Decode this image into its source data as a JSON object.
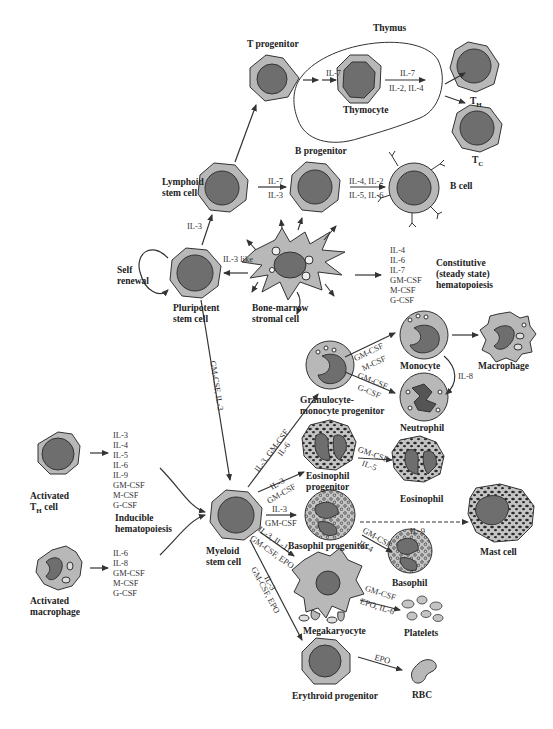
{
  "diagram": {
    "regions": {
      "thymus": "Thymus",
      "constitutive": [
        "Constitutive",
        "(steady state)",
        "hematopoiesis"
      ],
      "inducible": [
        "Inducible",
        "hematopoiesis"
      ]
    },
    "cells": {
      "t_progenitor": "T progenitor",
      "thymocyte": "Thymocyte",
      "th": "T",
      "th_sub": "H",
      "tc": "T",
      "tc_sub": "C",
      "b_progenitor": "B progenitor",
      "b_cell": "B cell",
      "lymphoid": [
        "Lymphoid",
        "stem cell"
      ],
      "self_renewal": [
        "Self",
        "renewal"
      ],
      "pluripotent": [
        "Pluripotent",
        "stem cell"
      ],
      "stromal": [
        "Bone-marrow",
        "stromal cell"
      ],
      "monocyte": "Monocyte",
      "macrophage": "Macrophage",
      "gm_progenitor": [
        "Granulocyte-",
        "monocyte progenitor"
      ],
      "neutrophil": "Neutrophil",
      "eos_progenitor": [
        "Eosinophil",
        "progenitor"
      ],
      "eosinophil": "Eosinophil",
      "baso_progenitor": "Basophil progenitor",
      "mast_cell": "Mast cell",
      "basophil": "Basophil",
      "megakaryocyte": "Megakaryocyte",
      "platelets": "Platelets",
      "erythroid": "Erythroid progenitor",
      "rbc": "RBC",
      "myeloid": [
        "Myeloid",
        "stem cell"
      ],
      "activated_th": [
        "Activated",
        "T",
        "H",
        " cell"
      ],
      "activated_mac": [
        "Activated",
        "macrophage"
      ]
    },
    "cytokines": {
      "tprog_thymocyte": "IL-7",
      "thymocyte_out_top": "IL-7",
      "thymocyte_out_bottom": "IL-2, IL-4",
      "lymphoid_bprog_top": "IL-7",
      "lymphoid_bprog_bottom": "IL-3",
      "bprog_bcell_top": "IL-4, IL-2",
      "bprog_bcell_bottom": "IL-5, IL-6",
      "pluri_lymphoid": "IL-3",
      "stromal_pluri": "IL-3 like",
      "stromal_list": [
        "IL-4",
        "IL-6",
        "IL-7",
        "GM-CSF",
        "M-CSF",
        "G-CSF"
      ],
      "pluri_myeloid": "GM-CSF, IL-3",
      "gm_mono_top": "GM-CSF",
      "gm_mono_bottom": "M-CSF",
      "gm_neut_top": "GM-CSF",
      "gm_neut_bottom": "G-CSF",
      "mono_neut": "IL-8",
      "myeloid_gm_top": "IL-3, GM-CSF",
      "myeloid_gm_bottom": "IL-6",
      "myeloid_eos_top": "IL-3",
      "myeloid_eos_bottom": "GM-CSF",
      "eos_top": "GM-CSF",
      "eos_bottom": "IL-5",
      "myeloid_baso_top": "IL-3",
      "myeloid_baso_bottom": "GM-CSF",
      "mast": "IL-9",
      "baso_top": "GM-CSF",
      "baso_bottom": "IL-4",
      "myeloid_mega_top": "IL-3, IL-11",
      "myeloid_mega_bottom": "GM-CSF, EPO",
      "myeloid_ery_top": "IL-3",
      "myeloid_ery_bottom": "GM-CSF, EPO",
      "mega_plt_top": "GM-CSF",
      "mega_plt_bottom": "EPO, IL-6",
      "ery_rbc": "EPO",
      "th_list": [
        "IL-3",
        "IL-4",
        "IL-5",
        "IL-6",
        "IL-9",
        "GM-CSF",
        "M-CSF",
        "G-CSF"
      ],
      "mac_list": [
        "IL-6",
        "IL-8",
        "GM-CSF",
        "M-CSF",
        "G-CSF"
      ]
    },
    "colors": {
      "cytoplasm": "#b8b8b8",
      "nucleus": "#6e6e6e",
      "outline": "#333333",
      "granule": "#2a2a2a",
      "background": "#ffffff"
    }
  }
}
